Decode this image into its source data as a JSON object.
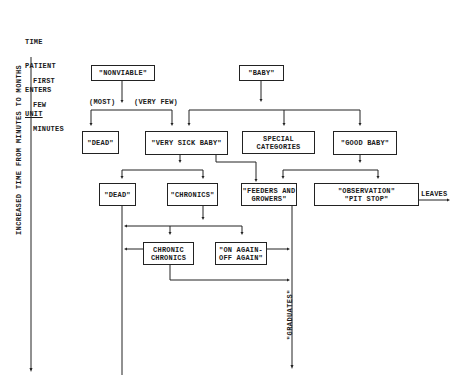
{
  "axis": {
    "start_label_lines": [
      "TIME",
      "PATIENT",
      "ENTERS",
      "UNIT"
    ],
    "first_label_lines": [
      "FIRST",
      "FEW",
      "MINUTES"
    ],
    "vertical_label": "INCREASED TIME FROM MINUTES TO MONTHS"
  },
  "nodes": {
    "nonviable": "\"NONVIABLE\"",
    "baby": "\"BABY\"",
    "dead1": "\"DEAD\"",
    "very_sick_baby": "\"VERY SICK BABY\"",
    "special_categories": "SPECIAL\nCATEGORIES",
    "good_baby": "\"GOOD BABY\"",
    "dead2": "\"DEAD\"",
    "chronics": "\"CHRONICS\"",
    "feeders_growers": "\"FEEDERS AND\nGROWERS\"",
    "observation": "\"OBSERVATION\"\n\"PIT STOP\"",
    "chronic_chronics": "CHRONIC\nCHRONICS",
    "on_again_off_again": "\"ON AGAIN-\nOFF AGAIN\""
  },
  "edge_labels": {
    "most": "(MOST)",
    "very_few": "(VERY FEW)",
    "leaves": "LEAVES",
    "graduates": "\"GRADUATES\""
  }
}
